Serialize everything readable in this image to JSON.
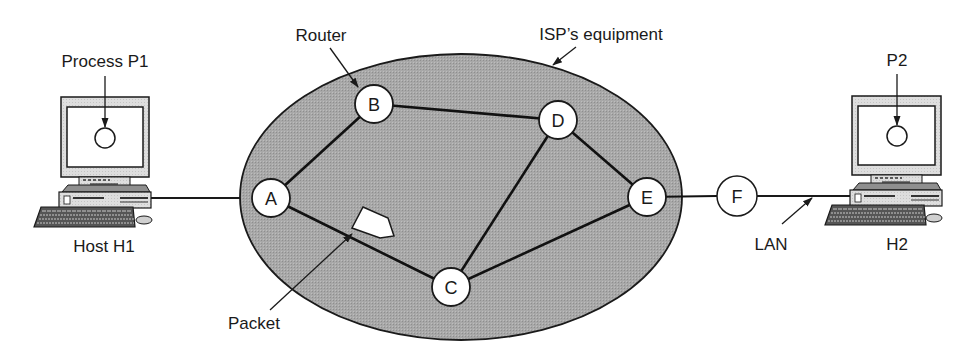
{
  "labels": {
    "process_p1": "Process P1",
    "host_h1": "Host H1",
    "router": "Router",
    "isp_equipment": "ISP’s equipment",
    "packet": "Packet",
    "lan": "LAN",
    "p2": "P2",
    "h2": "H2"
  },
  "colors": {
    "cloud_fill": "#a6a6a6",
    "stroke": "#1a1a1a",
    "node_fill": "#ffffff",
    "monitor_bezel": "#dcdcdc",
    "case_fill": "#c8c8c8"
  },
  "nodes": [
    {
      "id": "A",
      "label": "A",
      "x": 271,
      "y": 198
    },
    {
      "id": "B",
      "label": "B",
      "x": 374,
      "y": 104
    },
    {
      "id": "C",
      "label": "C",
      "x": 451,
      "y": 287
    },
    {
      "id": "D",
      "label": "D",
      "x": 558,
      "y": 120
    },
    {
      "id": "E",
      "label": "E",
      "x": 647,
      "y": 197
    },
    {
      "id": "F",
      "label": "F",
      "x": 737,
      "y": 196
    }
  ],
  "edges": [
    [
      "A",
      "B"
    ],
    [
      "B",
      "D"
    ],
    [
      "A",
      "C"
    ],
    [
      "C",
      "D"
    ],
    [
      "D",
      "E"
    ],
    [
      "C",
      "E"
    ],
    [
      "E",
      "F"
    ]
  ],
  "hosts": [
    {
      "id": "H1",
      "label": "Host H1",
      "process": "Process P1"
    },
    {
      "id": "H2",
      "label": "H2",
      "process": "P2"
    }
  ]
}
